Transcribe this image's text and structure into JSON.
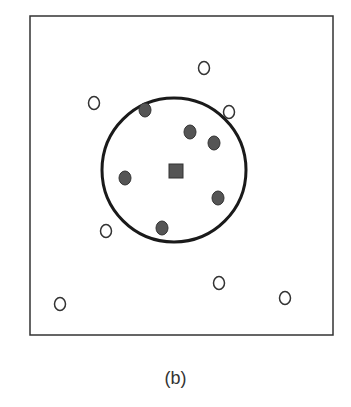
{
  "figure": {
    "caption": "(b)",
    "frame": {
      "x": 30,
      "y": 16,
      "width": 303,
      "height": 319,
      "stroke": "#333333"
    },
    "boundary_circle": {
      "cx": 174,
      "cy": 170,
      "r": 72,
      "stroke": "#1a1a1a",
      "stroke_width": 3
    },
    "center_marker": {
      "shape": "square",
      "cx": 176,
      "cy": 171,
      "size": 14,
      "fill": "#555555"
    },
    "filled_points": [
      {
        "cx": 145,
        "cy": 110
      },
      {
        "cx": 190,
        "cy": 132
      },
      {
        "cx": 214,
        "cy": 143
      },
      {
        "cx": 125,
        "cy": 178
      },
      {
        "cx": 218,
        "cy": 198
      },
      {
        "cx": 162,
        "cy": 228
      }
    ],
    "hollow_points": [
      {
        "cx": 204,
        "cy": 68
      },
      {
        "cx": 94,
        "cy": 103
      },
      {
        "cx": 229,
        "cy": 112
      },
      {
        "cx": 106,
        "cy": 231
      },
      {
        "cx": 219,
        "cy": 283
      },
      {
        "cx": 285,
        "cy": 298
      },
      {
        "cx": 60,
        "cy": 304
      }
    ],
    "colors": {
      "filled": "#555555",
      "filled_stroke": "#333333",
      "hollow_stroke": "#333333"
    }
  }
}
